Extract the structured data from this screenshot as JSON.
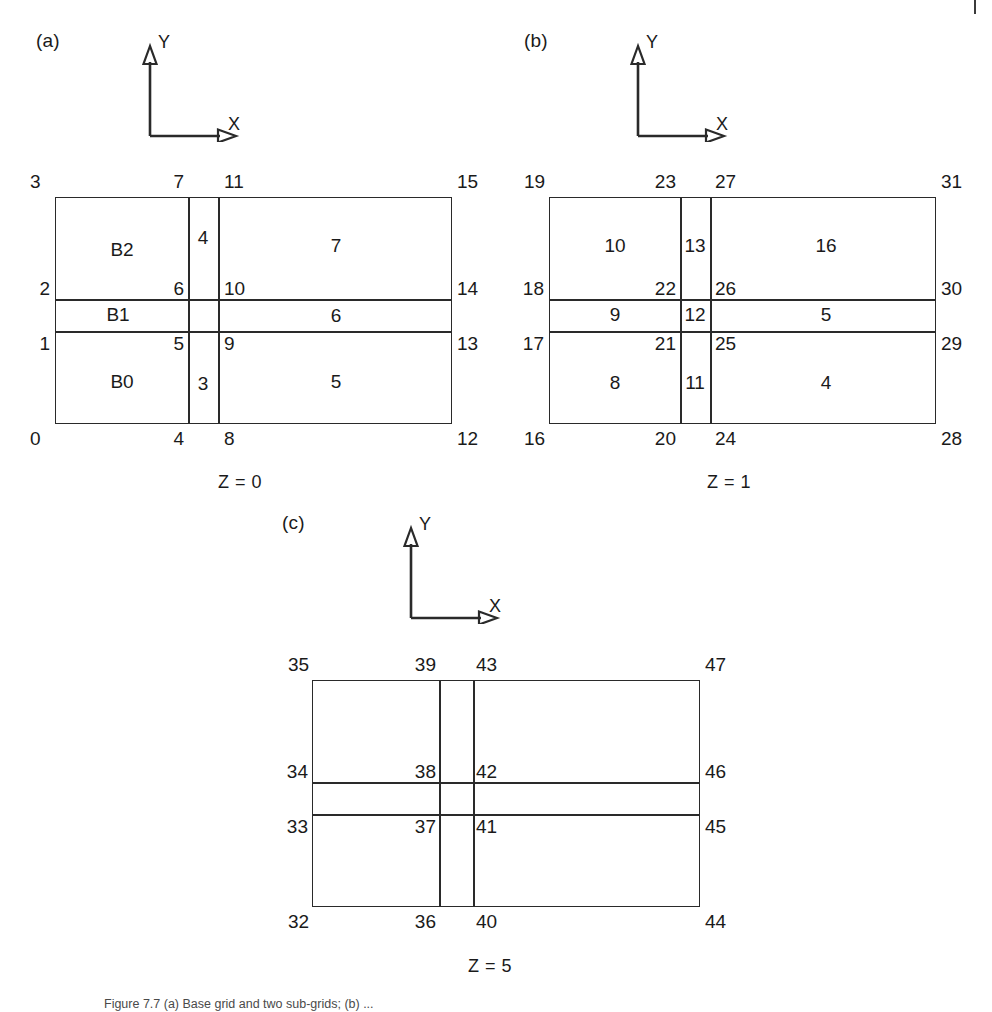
{
  "figure": {
    "axis_x_label": "X",
    "axis_y_label": "Y",
    "caption": "Figure 7.7  (a) Base grid and two sub-grids; (b) ..."
  },
  "panels": [
    {
      "tag": "(a)",
      "z_label": "Z = 0",
      "cells": [
        {
          "label": "B2",
          "col": 0,
          "row": 2
        },
        {
          "label": "4",
          "col": 1,
          "row": 2
        },
        {
          "label": "7",
          "col": 2,
          "row": 2
        },
        {
          "label": "B1",
          "col": 0,
          "row": 1
        },
        {
          "label": "6",
          "col": 2,
          "row": 1
        },
        {
          "label": "B0",
          "col": 0,
          "row": 0
        },
        {
          "label": "3",
          "col": 1,
          "row": 0
        },
        {
          "label": "5",
          "col": 2,
          "row": 0
        }
      ],
      "nodes": {
        "bottom": [
          "0",
          "4",
          "8",
          "12"
        ],
        "row1": [
          "1",
          "5",
          "9",
          "13"
        ],
        "row2": [
          "2",
          "6",
          "10",
          "14"
        ],
        "top": [
          "3",
          "7",
          "11",
          "15"
        ]
      }
    },
    {
      "tag": "(b)",
      "z_label": "Z = 1",
      "cells": [
        {
          "label": "10",
          "col": 0,
          "row": 2
        },
        {
          "label": "13",
          "col": 1,
          "row": 2
        },
        {
          "label": "16",
          "col": 2,
          "row": 2
        },
        {
          "label": "9",
          "col": 0,
          "row": 1
        },
        {
          "label": "12",
          "col": 1,
          "row": 1
        },
        {
          "label": "5",
          "col": 2,
          "row": 1
        },
        {
          "label": "8",
          "col": 0,
          "row": 0
        },
        {
          "label": "11",
          "col": 1,
          "row": 0
        },
        {
          "label": "4",
          "col": 2,
          "row": 0
        }
      ],
      "nodes": {
        "bottom": [
          "16",
          "20",
          "24",
          "28"
        ],
        "row1": [
          "17",
          "21",
          "25",
          "29"
        ],
        "row2": [
          "18",
          "22",
          "26",
          "30"
        ],
        "top": [
          "19",
          "23",
          "27",
          "31"
        ]
      }
    },
    {
      "tag": "(c)",
      "z_label": "Z = 5",
      "cells": [],
      "nodes": {
        "bottom": [
          "32",
          "36",
          "40",
          "44"
        ],
        "row1": [
          "33",
          "37",
          "41",
          "45"
        ],
        "row2": [
          "34",
          "38",
          "42",
          "46"
        ],
        "top": [
          "35",
          "39",
          "43",
          "47"
        ]
      }
    }
  ]
}
